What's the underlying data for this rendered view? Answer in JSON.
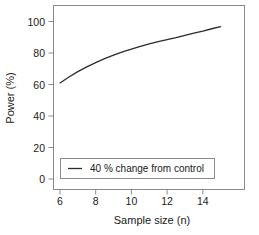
{
  "chart_data": {
    "type": "line",
    "title": "",
    "xlabel": "Sample size (n)",
    "ylabel": "Power (%)",
    "xlim": [
      5.3,
      15.6
    ],
    "ylim": [
      -4,
      108
    ],
    "xticks": [
      6,
      8,
      10,
      12,
      14
    ],
    "xtick_labels": [
      "6",
      "8",
      "10",
      "12",
      "14"
    ],
    "yticks": [
      0,
      20,
      40,
      60,
      80,
      100
    ],
    "ytick_labels": [
      "0",
      "20",
      "40",
      "60",
      "80",
      "100"
    ],
    "grid": false,
    "legend_position": "lower-left-inside",
    "series": [
      {
        "name": "40 % change from control",
        "color": "#2b2b2b",
        "x": [
          6,
          6.5,
          7,
          7.5,
          8,
          8.5,
          9,
          9.5,
          10,
          10.5,
          11,
          11.5,
          12,
          12.5,
          13,
          13.5,
          14,
          14.5,
          15
        ],
        "values": [
          61.0,
          64.8,
          68.2,
          71.2,
          73.9,
          76.4,
          78.7,
          80.7,
          82.5,
          84.2,
          85.8,
          87.2,
          88.5,
          89.7,
          91.2,
          92.6,
          93.9,
          95.4,
          96.8
        ]
      }
    ]
  },
  "legend": {
    "entries": [
      {
        "label": "40 % change from control"
      }
    ]
  },
  "axes": {
    "x_title": "Sample size (n)",
    "y_title": "Power (%)"
  },
  "colors": {
    "series": "#2b2b2b",
    "frame": "#8a8a8a",
    "background": "#ffffff",
    "text": "#1a1a1a"
  }
}
